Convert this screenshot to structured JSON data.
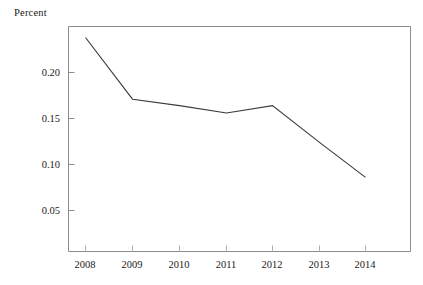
{
  "chart_data": {
    "type": "line",
    "title": "",
    "ylabel": "Percent",
    "xlabel": "",
    "categories": [
      "2008",
      "2009",
      "2010",
      "2011",
      "2012",
      "2013",
      "2014"
    ],
    "x": [
      2008,
      2009,
      2010,
      2011,
      2012,
      2013,
      2014
    ],
    "values": [
      0.238,
      0.171,
      0.164,
      0.156,
      0.164,
      0.124,
      0.086
    ],
    "series": [
      {
        "name": "Percent",
        "values": [
          0.238,
          0.171,
          0.164,
          0.156,
          0.164,
          0.124,
          0.086
        ]
      }
    ],
    "xtick_labels": [
      "2008",
      "2009",
      "2010",
      "2011",
      "2012",
      "2013",
      "2014"
    ],
    "ytick_labels": [
      "0.05",
      "0.10",
      "0.15",
      "0.20"
    ],
    "ytick_values": [
      0.05,
      0.1,
      0.15,
      0.2
    ],
    "ylim": [
      0.0,
      0.2435
    ],
    "xlim": [
      2007.65,
      2015.0
    ],
    "grid": false,
    "legend": "none",
    "line_color": "#3a3a3a",
    "axis_color": "#8c8c8c",
    "background": "#ffffff"
  },
  "labels": {
    "y_axis_caption": "Percent",
    "y_0": "0.05",
    "y_1": "0.10",
    "y_2": "0.15",
    "y_3": "0.20",
    "x_0": "2008",
    "x_1": "2009",
    "x_2": "2010",
    "x_3": "2011",
    "x_4": "2012",
    "x_5": "2013",
    "x_6": "2014"
  }
}
